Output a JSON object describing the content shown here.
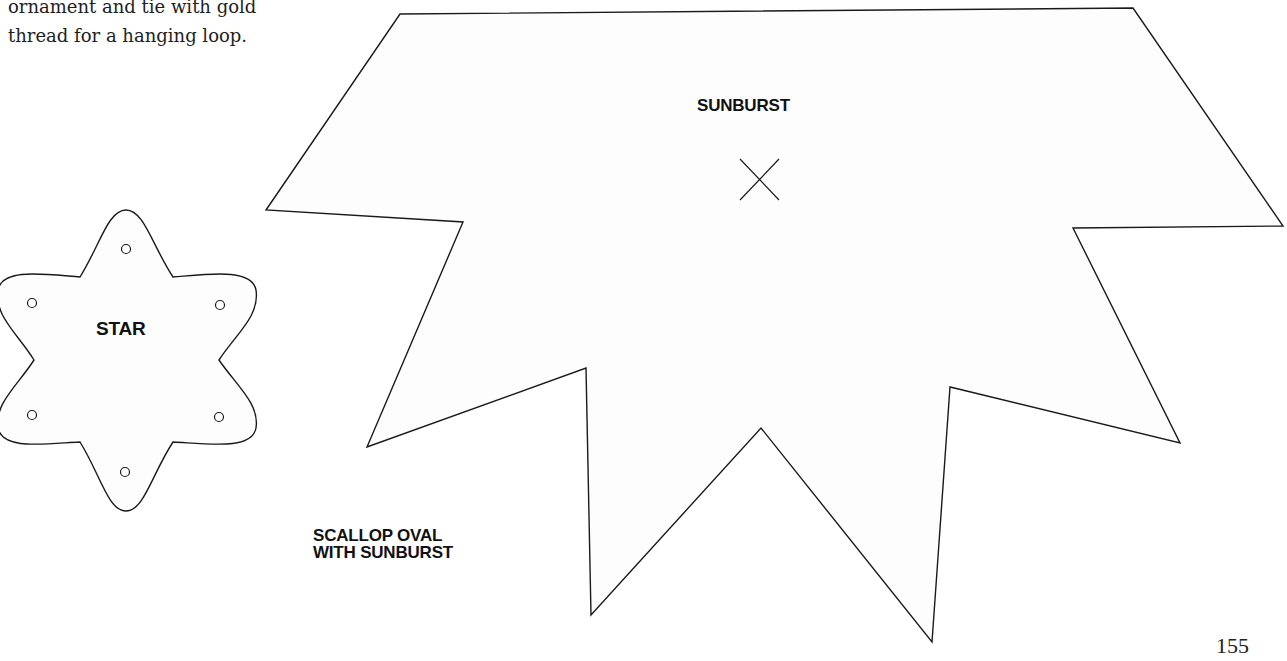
{
  "intro_text": {
    "lines": [
      "ornament and tie with gold",
      "thread for a hanging loop."
    ]
  },
  "templates": {
    "star": {
      "label": "STAR",
      "punch_holes": 6
    },
    "sunburst": {
      "label": "SUNBURST",
      "center_mark": "cross-mark"
    },
    "scallop_oval": {
      "label_lines": [
        "SCALLOP OVAL",
        "WITH SUNBURST"
      ]
    }
  },
  "page_number": "155",
  "colors": {
    "outline": "#1a1a1a",
    "fill": "#fdfdfd",
    "background": "#ffffff"
  }
}
